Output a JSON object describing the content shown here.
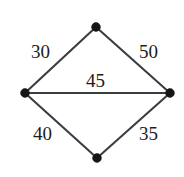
{
  "diagram": {
    "canvas": {
      "width": 184,
      "height": 177,
      "background_color": "#ffffff"
    },
    "style": {
      "edge_color": "#3c3c44",
      "edge_width": 2.1,
      "vertex_color": "#161616",
      "vertex_radius": 4.4,
      "label_color": "#1c1c1c",
      "label_font_size": 19
    },
    "vertices": [
      {
        "id": "top",
        "name": "top-vertex",
        "x": 96,
        "y": 27
      },
      {
        "id": "left",
        "name": "left-vertex",
        "x": 25,
        "y": 93
      },
      {
        "id": "right",
        "name": "right-vertex",
        "x": 170,
        "y": 93
      },
      {
        "id": "bottom",
        "name": "bottom-vertex",
        "x": 97,
        "y": 158
      }
    ],
    "edges": [
      {
        "id": "left-top",
        "from": "left",
        "to": "top",
        "weight": "30"
      },
      {
        "id": "top-right",
        "from": "top",
        "to": "right",
        "weight": "50"
      },
      {
        "id": "left-right",
        "from": "left",
        "to": "right",
        "weight": "45"
      },
      {
        "id": "left-bottom",
        "from": "left",
        "to": "bottom",
        "weight": "40"
      },
      {
        "id": "bottom-right",
        "from": "bottom",
        "to": "right",
        "weight": "35"
      }
    ],
    "labels": {
      "weight_top_left": "30",
      "weight_top_right": "50",
      "weight_middle": "45",
      "weight_bottom_left": "40",
      "weight_bottom_right": "35"
    }
  }
}
